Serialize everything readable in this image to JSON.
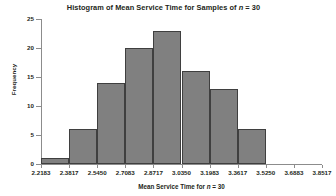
{
  "chart_data": {
    "type": "bar",
    "title": "Histogram of Mean Service Time for Samples of n = 30",
    "title_parts": {
      "before": "Histogram of Mean Service Time for Samples of ",
      "italic": "n",
      "after": " = 30"
    },
    "xlabel": "Mean Service Time for n = 30",
    "xlabel_parts": {
      "before": "Mean Service Time for ",
      "italic": "n",
      "after": " = 30"
    },
    "ylabel": "Frequency",
    "ylim": [
      0,
      25
    ],
    "yticks": [
      0,
      5,
      10,
      15,
      20,
      25
    ],
    "ytick_labels": [
      "0",
      "5",
      "10",
      "15",
      "20",
      "25"
    ],
    "bin_edges": [
      2.2183,
      2.3817,
      2.545,
      2.7083,
      2.8717,
      3.035,
      3.1983,
      3.3617,
      3.525,
      3.6883,
      3.8517
    ],
    "xtick_labels": [
      "2.2183",
      "2.3817",
      "2.5450",
      "2.7083",
      "2.8717",
      "3.0350",
      "3.1983",
      "3.3617",
      "3.5250",
      "3.6883",
      "3.8517"
    ],
    "categories": [
      "2.2183-2.3817",
      "2.3817-2.5450",
      "2.5450-2.7083",
      "2.7083-2.8717",
      "2.8717-3.0350",
      "3.0350-3.1983",
      "3.1983-3.3617",
      "3.3617-3.5250",
      "3.5250-3.6883"
    ],
    "values": [
      1,
      6,
      14,
      20,
      23,
      16,
      13,
      6,
      0
    ],
    "bars": [
      {
        "bin": "2.2183-2.3817",
        "value": 1
      },
      {
        "bin": "2.3817-2.5450",
        "value": 6
      },
      {
        "bin": "2.5450-2.7083",
        "value": 14
      },
      {
        "bin": "2.7083-2.8717",
        "value": 20
      },
      {
        "bin": "2.8717-3.0350",
        "value": 23
      },
      {
        "bin": "3.0350-3.1983",
        "value": 16
      },
      {
        "bin": "3.1983-3.3617",
        "value": 13
      },
      {
        "bin": "3.3617-3.5250",
        "value": 6
      }
    ],
    "grid": false,
    "legend": null,
    "colors": {
      "bar_fill": "#808080",
      "bar_edge": "#3f3f3f",
      "axis": "#8c8c8c",
      "text": "#231f20",
      "background": "#ffffff"
    }
  }
}
